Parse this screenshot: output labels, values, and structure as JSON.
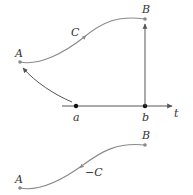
{
  "figure": {
    "top_diagram": {
      "points": {
        "A": {
          "label": "A",
          "x": 19,
          "y": 63
        },
        "B": {
          "label": "B",
          "x": 145,
          "y": 19
        },
        "a": {
          "label": "a",
          "x": 76,
          "y": 106
        },
        "b": {
          "label": "b",
          "x": 145,
          "y": 106
        }
      },
      "curve_label": "C",
      "axis_label": "t"
    },
    "bottom_diagram": {
      "points": {
        "A": {
          "label": "A",
          "x": 19,
          "y": 188
        },
        "B": {
          "label": "B",
          "x": 145,
          "y": 144
        }
      },
      "curve_label": "−C"
    },
    "colors": {
      "curve": "#8a8a8a",
      "axis": "#555555",
      "text": "#333333",
      "dot": "#111111"
    }
  }
}
